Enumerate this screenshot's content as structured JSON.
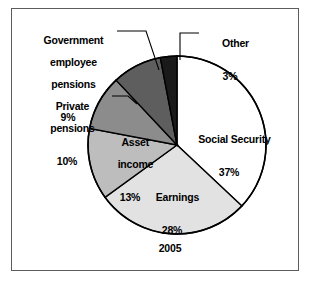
{
  "figure": {
    "caption": "2005",
    "frame_color": "#5c5c5c",
    "background": "#ffffff"
  },
  "chart_data": {
    "type": "pie",
    "title": "",
    "subtitle": "",
    "caption": "2005",
    "xlabel": "",
    "ylabel": "",
    "legend_position": "none",
    "grid": false,
    "units": "percent",
    "start_angle_deg": 0,
    "direction": "clockwise",
    "categories": [
      "Social Security",
      "Earnings",
      "Asset income",
      "Private pensions",
      "Government employee pensions",
      "Other"
    ],
    "values": [
      37,
      28,
      13,
      10,
      9,
      3
    ],
    "labels": [
      "Social Security",
      "Earnings",
      "Asset income",
      "Private pensions",
      "Government employee pensions",
      "Other"
    ],
    "value_labels": [
      "37%",
      "28%",
      "13%",
      "10%",
      "9%",
      "3%"
    ],
    "colors": [
      "#ffffff",
      "#e2e2e2",
      "#bdbdbd",
      "#8c8c8c",
      "#5e5e5e",
      "#1a1a1a"
    ],
    "slice_border_color": "#000000",
    "slices": [
      {
        "name": "Social Security",
        "value": 37,
        "value_label": "37%",
        "color": "#ffffff",
        "label_placement": "inside"
      },
      {
        "name": "Earnings",
        "value": 28,
        "value_label": "28%",
        "color": "#e2e2e2",
        "label_placement": "inside"
      },
      {
        "name": "Asset income",
        "value": 13,
        "value_label": "13%",
        "color": "#bdbdbd",
        "label_placement": "inside"
      },
      {
        "name": "Private pensions",
        "value": 10,
        "value_label": "10%",
        "color": "#8c8c8c",
        "label_placement": "outside-leader"
      },
      {
        "name": "Government employee pensions",
        "value": 9,
        "value_label": "9%",
        "color": "#5e5e5e",
        "label_placement": "outside-leader"
      },
      {
        "name": "Other",
        "value": 3,
        "value_label": "3%",
        "color": "#1a1a1a",
        "label_placement": "outside-leader"
      }
    ]
  },
  "labels": {
    "government_pensions": {
      "line1": "Government",
      "line2": "employee",
      "line3": "pensions",
      "percent": "9%"
    },
    "private_pensions": {
      "line1": "Private",
      "line2": "pensions",
      "percent": "10%"
    },
    "other": {
      "line1": "Other",
      "percent": "3%"
    },
    "social_security": {
      "line1": "Social Security",
      "percent": "37%"
    },
    "earnings": {
      "line1": "Earnings",
      "percent": "28%"
    },
    "asset_income": {
      "line1": "Asset",
      "line2": "income",
      "percent": "13%"
    }
  }
}
